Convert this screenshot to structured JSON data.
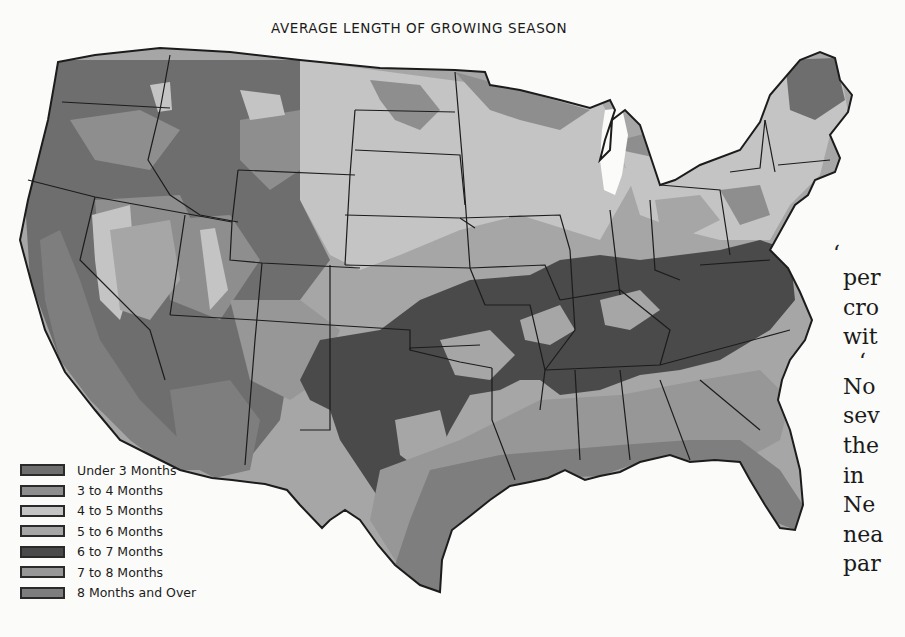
{
  "title": "AVERAGE LENGTH OF GROWING SEASON",
  "legend": {
    "items": [
      {
        "label": "Under 3 Months",
        "color": "#6e6e6e"
      },
      {
        "label": "3 to 4 Months",
        "color": "#8e8e8e"
      },
      {
        "label": "4 to 5 Months",
        "color": "#c4c4c4"
      },
      {
        "label": "5 to 6 Months",
        "color": "#a6a6a6"
      },
      {
        "label": "6 to 7 Months",
        "color": "#4a4a4a"
      },
      {
        "label": "7 to 8 Months",
        "color": "#979797"
      },
      {
        "label": "8 Months and Over",
        "color": "#7e7e7e"
      }
    ]
  },
  "side_text": {
    "lines": [
      "‘",
      "per",
      "cro",
      "wit",
      "‘",
      "No",
      "sev",
      "the",
      "in",
      "Ne",
      "nea",
      "par"
    ]
  },
  "map": {
    "region": "United States (contiguous)",
    "regions": [
      {
        "name": "Northern Rockies / Pacific Northwest",
        "category": "Under 3 Months"
      },
      {
        "name": "Northern Plains / Upper Midwest",
        "category": "4 to 5 Months"
      },
      {
        "name": "Central Plains / Corn Belt",
        "category": "5 to 6 Months"
      },
      {
        "name": "Ozarks–Tennessee–Virginia belt",
        "category": "6 to 7 Months"
      },
      {
        "name": "Lower South",
        "category": "7 to 8 Months"
      },
      {
        "name": "Gulf Coast / Florida / California valleys",
        "category": "8 Months and Over"
      }
    ]
  }
}
